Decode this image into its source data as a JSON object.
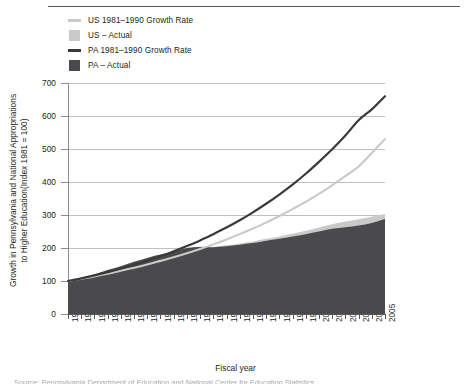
{
  "legend": {
    "items": [
      {
        "label": "US   1981–1990 Growth Rate",
        "swatch": "line-light",
        "color": "#c9c9c9"
      },
      {
        "label": "US – Actual",
        "swatch": "box-light",
        "color": "#c9c9c9"
      },
      {
        "label": "PA   1981–1990 Growth Rate",
        "swatch": "line-dark",
        "color": "#3a3a3c"
      },
      {
        "label": "PA – Actual",
        "swatch": "box-dark",
        "color": "#4a4a4c"
      }
    ]
  },
  "caption": {
    "cutoff_text": "Source: Pennsylvania Department of Education and National Center for Education Statistics"
  },
  "chart_data": {
    "type": "area",
    "title": "",
    "xlabel": "Fiscal year",
    "ylabel": "Growth in Pennsylvania and National Appropriations to Higher Education(Index 1981 = 100)",
    "ylim": [
      0,
      700
    ],
    "ytick_step": 100,
    "yticks": [
      0,
      100,
      200,
      300,
      400,
      500,
      600,
      700
    ],
    "grid": true,
    "legend_position": "top-left",
    "x": [
      1981,
      1982,
      1983,
      1984,
      1985,
      1986,
      1987,
      1988,
      1989,
      1990,
      1991,
      1992,
      1993,
      1994,
      1995,
      1996,
      1997,
      1998,
      1999,
      2000,
      2001,
      2002,
      2003,
      2004,
      2005
    ],
    "xtick_labels": [
      "1981",
      "1982",
      "1983",
      "1984",
      "1985",
      "1986",
      "1987",
      "1988",
      "1989",
      "1990",
      "1991",
      "1992",
      "1993",
      "1994",
      "1995",
      "1996",
      "1997",
      "1998",
      "1999",
      "2000",
      "2001",
      "2002",
      "2003",
      "2004",
      "2005"
    ],
    "series": [
      {
        "name": "PA – Actual",
        "kind": "area",
        "color": "#4a4a4c",
        "values": [
          100,
          110,
          120,
          133,
          145,
          158,
          170,
          180,
          190,
          200,
          203,
          202,
          205,
          210,
          215,
          222,
          228,
          235,
          242,
          250,
          258,
          263,
          268,
          276,
          288
        ]
      },
      {
        "name": "US – Actual",
        "kind": "area",
        "color": "#c9c9c9",
        "values": [
          100,
          110,
          120,
          133,
          145,
          158,
          170,
          180,
          190,
          200,
          204,
          204,
          208,
          214,
          220,
          228,
          235,
          243,
          252,
          262,
          272,
          280,
          287,
          295,
          303
        ]
      },
      {
        "name": "PA   1981–1990 Growth Rate",
        "kind": "line",
        "color": "#3a3a3c",
        "values": [
          100,
          108,
          117,
          127,
          138,
          149,
          162,
          175,
          190,
          206,
          223,
          242,
          262,
          284,
          308,
          334,
          362,
          392,
          425,
          461,
          499,
          541,
          587,
          620,
          660
        ]
      },
      {
        "name": "US   1981–1990 Growth Rate",
        "kind": "line",
        "color": "#c9c9c9",
        "values": [
          100,
          107,
          114,
          122,
          131,
          140,
          150,
          161,
          172,
          184,
          197,
          211,
          226,
          242,
          259,
          277,
          297,
          318,
          340,
          364,
          390,
          418,
          447,
          488,
          530
        ]
      }
    ]
  }
}
